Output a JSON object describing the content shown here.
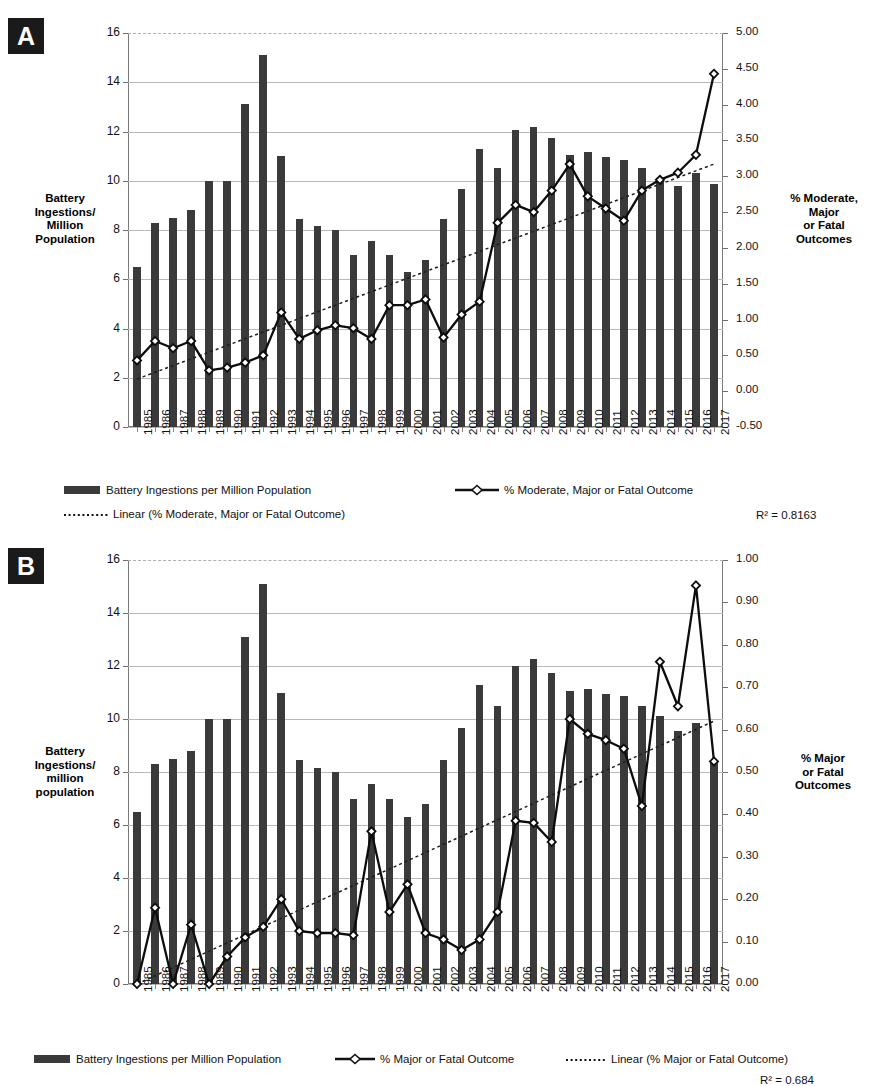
{
  "figure": {
    "panels": [
      {
        "tag": "A",
        "left_axis_title": "Battery\nIngestions/\nMillion\nPopulation",
        "right_axis_title": "% Moderate,\nMajor\nor Fatal\nOutcomes",
        "r2_label": "R² = 0.8163",
        "legend": [
          {
            "type": "bar",
            "label": "Battery Ingestions per Million Population"
          },
          {
            "type": "line-marker",
            "label": "% Moderate, Major or Fatal Outcome"
          },
          {
            "type": "dotted",
            "label": "Linear (% Moderate, Major or Fatal Outcome)"
          }
        ]
      },
      {
        "tag": "B",
        "left_axis_title": "Battery\nIngestions/\nmillion\npopulation",
        "right_axis_title": "% Major\nor Fatal\nOutcomes",
        "r2_label": "R² = 0.684",
        "legend": [
          {
            "type": "bar",
            "label": "Battery Ingestions per Million Population"
          },
          {
            "type": "line-marker",
            "label": "% Major or Fatal Outcome"
          },
          {
            "type": "dotted",
            "label": "Linear (% Major or Fatal Outcome)"
          }
        ]
      }
    ]
  },
  "chart_data": [
    {
      "type": "bar",
      "panel": "A",
      "title": "",
      "xlabel": "",
      "ylabel": "Battery Ingestions/ Million Population",
      "y2label": "% Moderate, Major or Fatal Outcomes",
      "grid": true,
      "legend_position": "bottom",
      "categories": [
        "1985",
        "1986",
        "1987",
        "1988",
        "1989",
        "1990",
        "1991",
        "1992",
        "1993",
        "1994",
        "1995",
        "1996",
        "1997",
        "1998",
        "1999",
        "2000",
        "2001",
        "2002",
        "2003",
        "2004",
        "2005",
        "2006",
        "2007",
        "2008",
        "2009",
        "2010",
        "2011",
        "2012",
        "2013",
        "2014",
        "2015",
        "2016",
        "2017"
      ],
      "ylim": [
        0,
        16
      ],
      "yticks": [
        0,
        2,
        4,
        6,
        8,
        10,
        12,
        14,
        16
      ],
      "y2lim": [
        -0.5,
        5.0
      ],
      "y2ticks": [
        "-0.50",
        "0.00",
        "0.50",
        "1.00",
        "1.50",
        "2.00",
        "2.50",
        "3.00",
        "3.50",
        "4.00",
        "4.50",
        "5.00"
      ],
      "series": [
        {
          "name": "Battery Ingestions per Million Population",
          "axis": "left",
          "kind": "bar",
          "values": [
            6.5,
            8.3,
            8.5,
            8.8,
            10.0,
            10.0,
            13.1,
            15.1,
            11.0,
            8.45,
            8.15,
            8.0,
            7.0,
            7.55,
            7.0,
            6.3,
            6.8,
            8.45,
            9.65,
            11.3,
            10.5,
            12.05,
            12.2,
            11.75,
            11.05,
            11.15,
            10.95,
            10.85,
            10.5,
            10.1,
            9.8,
            10.3,
            9.85
          ]
        },
        {
          "name": "% Moderate, Major or Fatal Outcome",
          "axis": "right",
          "kind": "line",
          "values": [
            0.43,
            0.7,
            0.6,
            0.7,
            0.29,
            0.33,
            0.4,
            0.5,
            1.1,
            0.73,
            0.85,
            0.92,
            0.88,
            0.73,
            1.2,
            1.2,
            1.28,
            0.75,
            1.07,
            1.25,
            2.35,
            2.6,
            2.5,
            2.8,
            3.17,
            2.72,
            2.55,
            2.38,
            2.8,
            2.95,
            3.05,
            3.3,
            4.43
          ]
        },
        {
          "name": "Linear (% Moderate, Major or Fatal Outcome)",
          "axis": "right",
          "kind": "trend",
          "endpoints": [
            0.17,
            3.17
          ]
        }
      ]
    },
    {
      "type": "bar",
      "panel": "B",
      "title": "",
      "xlabel": "",
      "ylabel": "Battery Ingestions/ million population",
      "y2label": "% Major or Fatal Outcomes",
      "grid": true,
      "legend_position": "bottom",
      "categories": [
        "1985",
        "1986",
        "1987",
        "1988",
        "1989",
        "1990",
        "1991",
        "1992",
        "1993",
        "1994",
        "1995",
        "1996",
        "1997",
        "1998",
        "1999",
        "2000",
        "2001",
        "2002",
        "2003",
        "2004",
        "2005",
        "2006",
        "2007",
        "2008",
        "2009",
        "2010",
        "2011",
        "2012",
        "2013",
        "2014",
        "2015",
        "2016",
        "2017"
      ],
      "ylim": [
        0,
        16
      ],
      "yticks": [
        0,
        2,
        4,
        6,
        8,
        10,
        12,
        14,
        16
      ],
      "y2lim": [
        0.0,
        1.0
      ],
      "y2ticks": [
        "0.00",
        "0.10",
        "0.20",
        "0.30",
        "0.40",
        "0.50",
        "0.60",
        "0.70",
        "0.80",
        "0.90",
        "1.00"
      ],
      "series": [
        {
          "name": "Battery Ingestions per Million Population",
          "axis": "left",
          "kind": "bar",
          "values": [
            6.5,
            8.3,
            8.5,
            8.8,
            10.0,
            10.0,
            13.1,
            15.1,
            11.0,
            8.45,
            8.15,
            8.0,
            7.0,
            7.55,
            7.0,
            6.3,
            6.8,
            8.45,
            9.65,
            11.3,
            10.5,
            12.0,
            12.25,
            11.75,
            11.05,
            11.15,
            10.95,
            10.85,
            10.5,
            10.1,
            9.55,
            9.85,
            8.4
          ]
        },
        {
          "name": "% Major or Fatal Outcome",
          "axis": "right",
          "kind": "line",
          "values": [
            0.0,
            0.18,
            0.0,
            0.14,
            0.0,
            0.065,
            0.11,
            0.135,
            0.2,
            0.125,
            0.12,
            0.12,
            0.115,
            0.36,
            0.17,
            0.235,
            0.12,
            0.105,
            0.08,
            0.105,
            0.17,
            0.385,
            0.38,
            0.335,
            0.625,
            0.59,
            0.575,
            0.555,
            0.42,
            0.76,
            0.655,
            0.94,
            0.525
          ]
        },
        {
          "name": "Linear (% Major or Fatal Outcome)",
          "axis": "right",
          "kind": "trend",
          "endpoints": [
            0.0,
            0.62
          ]
        }
      ]
    }
  ]
}
